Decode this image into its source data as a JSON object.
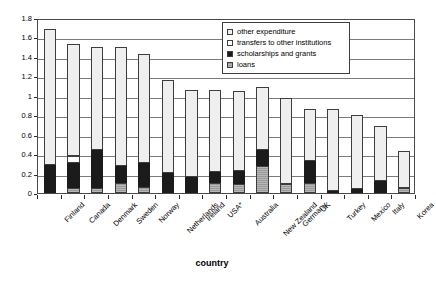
{
  "chart_data": {
    "type": "bar",
    "stacked": true,
    "title": "",
    "xlabel": "country",
    "ylabel": "%GDP",
    "ylim": [
      0,
      1.8
    ],
    "ytick_step": 0.2,
    "yticks": [
      "0",
      "0.2",
      "0.4",
      "0.6",
      "0.8",
      "1",
      "1.2",
      "1.4",
      "1.6",
      "1.8"
    ],
    "grid": true,
    "legend_position": "top-right",
    "categories": [
      "Finland",
      "Canada",
      "Denmark",
      "Sweden",
      "Norway",
      "Netherlands",
      "Ireland",
      "USA*",
      "Australia",
      "New Zealand",
      "Germany",
      "UK",
      "Turkey",
      "Mexico",
      "Italy",
      "Korea"
    ],
    "series": [
      {
        "name": "loans",
        "color": "#9a9a9a",
        "values": [
          0.0,
          0.05,
          0.05,
          0.1,
          0.06,
          0.0,
          0.0,
          0.1,
          0.09,
          0.28,
          0.09,
          0.1,
          0.0,
          0.0,
          0.0,
          0.05
        ]
      },
      {
        "name": "scholarships and grants",
        "color": "#1b1b1b",
        "values": [
          0.29,
          0.26,
          0.39,
          0.18,
          0.25,
          0.21,
          0.17,
          0.12,
          0.14,
          0.16,
          0.0,
          0.23,
          0.02,
          0.04,
          0.12,
          0.0
        ]
      },
      {
        "name": "transfers to other institutions",
        "color": "#ffffff",
        "values": [
          0.0,
          0.07,
          0.0,
          0.0,
          0.0,
          0.0,
          0.0,
          0.0,
          0.0,
          0.0,
          0.0,
          0.0,
          0.0,
          0.0,
          0.0,
          0.0
        ]
      },
      {
        "name": "other expenditure",
        "color": "#efefef",
        "values": [
          1.4,
          1.15,
          1.06,
          1.22,
          1.12,
          0.95,
          0.89,
          0.84,
          0.82,
          0.65,
          0.89,
          0.53,
          0.84,
          0.76,
          0.57,
          0.38
        ]
      }
    ],
    "totals": [
      1.69,
      1.53,
      1.5,
      1.5,
      1.43,
      1.16,
      1.06,
      1.06,
      1.05,
      1.09,
      0.98,
      0.86,
      0.86,
      0.8,
      0.69,
      0.43
    ]
  },
  "legend": {
    "items": [
      {
        "label": "other expenditure",
        "swatch": "other"
      },
      {
        "label": "transfers to other institutions",
        "swatch": "transfers"
      },
      {
        "label": "scholarships and grants",
        "swatch": "scholar"
      },
      {
        "label": "loans",
        "swatch": "loans"
      }
    ]
  },
  "axes": {
    "y_title": "%GDP",
    "x_title": "country"
  }
}
